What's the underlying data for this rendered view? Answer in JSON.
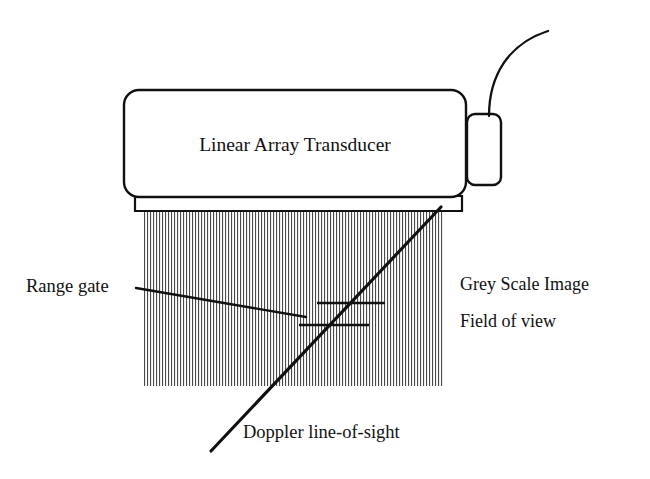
{
  "figure": {
    "title_in_body": "Linear Array Transducer",
    "labels": {
      "range_gate": "Range gate",
      "grey_scale_image": "Grey Scale Image",
      "field_of_view": "Field of view",
      "doppler_line_of_sight": "Doppler line-of-sight"
    },
    "colors": {
      "ink": "#111111",
      "hatch": "#555555",
      "background": "#ffffff"
    },
    "parts": {
      "transducer_body": "transducer-body",
      "footplate": "transducer-footplate",
      "connector_box": "connector-box",
      "cable": "cable",
      "field_of_view_hatch": "field-of-view-hatch",
      "doppler_beam": "doppler-beam-line",
      "range_gate_upper_marker": "range-gate-upper-marker",
      "range_gate_lower_marker": "range-gate-lower-marker",
      "range_gate_leader": "range-gate-leader-line"
    }
  }
}
